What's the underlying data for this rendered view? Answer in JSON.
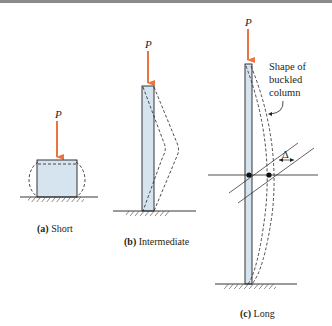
{
  "figure": {
    "load_label": "P",
    "colors": {
      "load_arrow": "#e9743f",
      "column_fill": "#d6e4f0",
      "line": "#231f20",
      "top_rule": "#8a8a8a"
    },
    "panels": [
      {
        "id": "a",
        "caption_prefix": "(a)",
        "caption_text": " Short"
      },
      {
        "id": "b",
        "caption_prefix": "(b)",
        "caption_text": " Intermediate"
      },
      {
        "id": "c",
        "caption_prefix": "(c)",
        "caption_text": " Long"
      }
    ],
    "annotation": {
      "line1": "Shape of",
      "line2": "buckled",
      "line3": "column",
      "delta_symbol": "Δ"
    }
  }
}
